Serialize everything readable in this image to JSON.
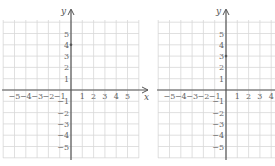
{
  "graphs": [
    {
      "id": "left",
      "x_axis_label": "x",
      "y_axis_label": "y",
      "x_ticks": [
        "−5",
        "−4",
        "−3",
        "−2",
        "−1",
        "1",
        "2",
        "3",
        "4",
        "5"
      ],
      "y_ticks_pos": [
        "1",
        "2",
        "3",
        "4",
        "5"
      ],
      "y_ticks_neg": [
        "−1",
        "−2",
        "−3",
        "−4",
        "−5"
      ],
      "marked_point": {
        "x": 0,
        "y": 4
      }
    },
    {
      "id": "right",
      "x_axis_label": "x",
      "y_axis_label": "y",
      "x_ticks": [
        "−5",
        "−4",
        "−3",
        "−2",
        "−1",
        "1",
        "2",
        "3",
        "4"
      ],
      "y_ticks_pos": [
        "1",
        "2",
        "3",
        "4",
        "5"
      ],
      "y_ticks_neg": [
        "−1",
        "−2",
        "−3",
        "−4",
        "−5"
      ],
      "marked_point": {
        "x": 0,
        "y": 3
      }
    }
  ],
  "chart_data": [
    {
      "type": "scatter",
      "title": "",
      "xlabel": "x",
      "ylabel": "y",
      "xlim": [
        -6,
        6
      ],
      "ylim": [
        -6,
        6
      ],
      "grid": true,
      "x_tick_labels": [
        "-5",
        "-4",
        "-3",
        "-2",
        "-1",
        "1",
        "2",
        "3",
        "4",
        "5"
      ],
      "y_tick_labels": [
        "-5",
        "-4",
        "-3",
        "-2",
        "-1",
        "1",
        "2",
        "3",
        "4",
        "5"
      ],
      "points": [
        {
          "x": 0,
          "y": 4
        }
      ]
    },
    {
      "type": "scatter",
      "title": "",
      "xlabel": "x",
      "ylabel": "y",
      "xlim": [
        -6,
        6
      ],
      "ylim": [
        -6,
        6
      ],
      "grid": true,
      "x_tick_labels": [
        "-5",
        "-4",
        "-3",
        "-2",
        "-1",
        "1",
        "2",
        "3",
        "4"
      ],
      "y_tick_labels": [
        "-5",
        "-4",
        "-3",
        "-2",
        "-1",
        "1",
        "2",
        "3",
        "4",
        "5"
      ],
      "points": [
        {
          "x": 0,
          "y": 3
        }
      ]
    }
  ]
}
